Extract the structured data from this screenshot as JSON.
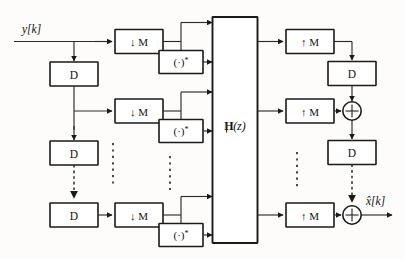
{
  "figure": {
    "type": "block-diagram",
    "domain": "signal-processing"
  },
  "io": {
    "input_label": "y[k]",
    "output_label": "x̂[k]"
  },
  "blocks": {
    "delay_label": "D",
    "decimator_label": "↓ M",
    "interpolator_label": "↑ M",
    "conjugate_label": "(·)*",
    "conjugate_base": "(·)",
    "conjugate_sup": "*",
    "matrix_label": "ℍ(z)",
    "matrix_letter": "H",
    "matrix_arg": "(z)",
    "sum_label": "+"
  },
  "analysis_rows": [
    {
      "id": "row-0",
      "decimator": "↓ M",
      "conjugate": "(·)*"
    },
    {
      "id": "row-1",
      "decimator": "↓ M",
      "conjugate": "(·)*"
    },
    {
      "id": "row-last",
      "decimator": "↓ M",
      "conjugate": "(·)*"
    }
  ],
  "delay_chain": [
    {
      "id": "delay-0",
      "label": "D"
    },
    {
      "id": "delay-1",
      "label": "D"
    },
    {
      "id": "delay-last",
      "label": "D"
    }
  ],
  "synthesis_rows": [
    {
      "id": "syn-0",
      "interpolator": "↑ M",
      "delay": "D",
      "adder": null
    },
    {
      "id": "syn-1",
      "interpolator": "↑ M",
      "delay": "D",
      "adder": "+"
    },
    {
      "id": "syn-last",
      "interpolator": "↑ M",
      "delay": null,
      "adder": "+"
    }
  ],
  "ellipses": {
    "count": 5,
    "note": "vertical dashed ellipsis indicating repeated branches"
  },
  "colors": {
    "background": "#fdfcfa",
    "line": "#2a2a2a",
    "block_stroke": "#1a1a1a",
    "block_fill": "#ffffff",
    "text": "#111111"
  }
}
